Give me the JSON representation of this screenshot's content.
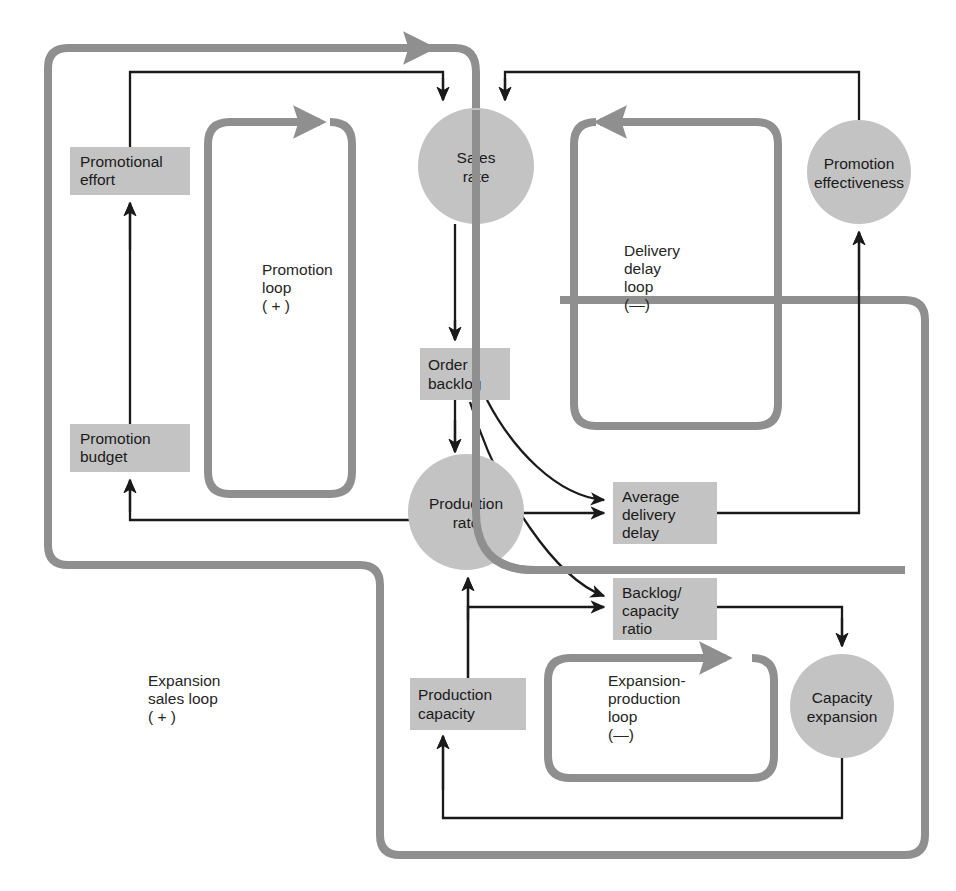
{
  "diagram": {
    "colors": {
      "node_fill": "#c3c3c3",
      "thick_loop": "#8f8f8f",
      "thin_link": "#1a1a1a",
      "text": "#1a1a1a",
      "background": "#ffffff"
    },
    "boxes": [
      {
        "id": "promotional-effort",
        "label": "Promotional\neffort",
        "line1": "Promotional",
        "line2": "effort",
        "x": 70,
        "y": 147,
        "w": 120,
        "h": 48
      },
      {
        "id": "promotion-budget",
        "label": "Promotion\nbudget",
        "line1": "Promotion",
        "line2": "budget",
        "x": 70,
        "y": 424,
        "w": 120,
        "h": 48
      },
      {
        "id": "order-backlog",
        "label": "Order\nbacklog",
        "line1": "Order",
        "line2": "backlog",
        "x": 420,
        "y": 348,
        "w": 90,
        "h": 52
      },
      {
        "id": "average-delivery-delay",
        "label": "Average\ndelivery\ndelay",
        "line1": "Average",
        "line2": "delivery",
        "line3": "delay",
        "x": 613,
        "y": 482,
        "w": 104,
        "h": 62
      },
      {
        "id": "backlog-capacity-ratio",
        "label": "Backlog/\ncapacity\nratio",
        "line1": "Backlog/",
        "line2": "capacity",
        "line3": "ratio",
        "x": 613,
        "y": 578,
        "w": 104,
        "h": 62
      },
      {
        "id": "production-capacity",
        "label": "Production\ncapacity",
        "line1": "Production",
        "line2": "capacity",
        "x": 410,
        "y": 678,
        "w": 116,
        "h": 52
      }
    ],
    "circles": [
      {
        "id": "sales-rate",
        "label": "Sales\nrate",
        "line1": "Sales",
        "line2": "rate",
        "cx": 476,
        "cy": 166,
        "r": 58
      },
      {
        "id": "promotion-effectiveness",
        "label": "Promotion\neffectiveness",
        "line1": "Promotion",
        "line2": "effectiveness",
        "cx": 859,
        "cy": 172,
        "r": 52
      },
      {
        "id": "production-rate",
        "label": "Production\nrate",
        "line1": "Production",
        "line2": "rate",
        "cx": 466,
        "cy": 512,
        "r": 58
      },
      {
        "id": "capacity-expansion",
        "label": "Capacity\nexpansion",
        "line1": "Capacity",
        "line2": "expansion",
        "cx": 842,
        "cy": 706,
        "r": 52
      }
    ],
    "loops": [
      {
        "id": "promotion-loop",
        "line1": "Promotion",
        "line2": "loop",
        "line3": "( + )",
        "sign": "+",
        "text_x": 262,
        "text_y": 275
      },
      {
        "id": "delivery-delay-loop",
        "line1": "Delivery",
        "line2": "delay",
        "line3": "loop",
        "line4": "(—)",
        "sign": "−",
        "text_x": 624,
        "text_y": 256
      },
      {
        "id": "expansion-production-loop",
        "line1": "Expansion-",
        "line2": "production",
        "line3": "loop",
        "line4": "(—)",
        "sign": "−",
        "text_x": 608,
        "text_y": 686
      },
      {
        "id": "expansion-sales-loop",
        "line1": "Expansion",
        "line2": "sales loop",
        "line3": "( + )",
        "sign": "+",
        "text_x": 148,
        "text_y": 686
      }
    ]
  }
}
